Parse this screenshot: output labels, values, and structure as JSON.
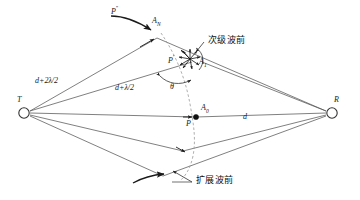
{
  "figure": {
    "type": "optical-wave-propagation-diagram",
    "background_color": "#ffffff",
    "line_color": "#4a4a4a",
    "text_color": "#1a1a1a",
    "dash_color": "#8a8a8a"
  },
  "nodes": {
    "transmitter": {
      "label": "T",
      "x": 24,
      "y": 112,
      "shape": "circle-open"
    },
    "receiver": {
      "label": "R",
      "x": 332,
      "y": 112,
      "shape": "circle-open"
    },
    "center_point": {
      "label": "P",
      "x": 196,
      "y": 117,
      "shape": "dot-filled"
    }
  },
  "point_labels": {
    "p_double_prime": "P",
    "p_double_prime_sup": "''",
    "p_prime": "P",
    "p_prime_sup": "'",
    "p_center": "P",
    "a_n": "A",
    "a_n_sub": "N",
    "a_1": "A",
    "a_1_sub": "1",
    "a_0": "A",
    "a_0_sub": "0"
  },
  "distance_labels": {
    "path_two": "d+2λ/2",
    "path_one": "d+λ/2",
    "path_direct": "d",
    "angle": "θ"
  },
  "annotations": {
    "secondary_wavefront": "次级波前",
    "expanding_wavefront": "扩展波前"
  }
}
